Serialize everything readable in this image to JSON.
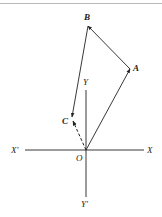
{
  "diagram": {
    "type": "vector-diagram",
    "axes": {
      "x_positive_label": "X",
      "x_negative_label": "X′",
      "y_positive_label": "Y",
      "y_negative_label": "Y′",
      "origin_label": "O"
    },
    "points": {
      "A": {
        "label": "A"
      },
      "B": {
        "label": "B"
      },
      "C": {
        "label": "C"
      }
    },
    "vectors": [
      {
        "from": "O",
        "to": "A",
        "style": "solid"
      },
      {
        "from": "A",
        "to": "B",
        "style": "solid"
      },
      {
        "from": "B",
        "to": "C",
        "style": "solid"
      },
      {
        "from": "O",
        "to": "C",
        "style": "dashed"
      }
    ],
    "colors": {
      "stroke": "#222222",
      "rule": "#b8b8b8"
    }
  }
}
